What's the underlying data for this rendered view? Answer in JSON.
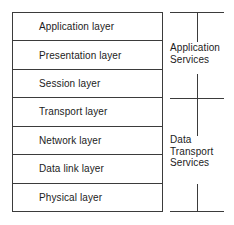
{
  "diagram": {
    "colors": {
      "line": "#3b3b3b",
      "text": "#1c1c1c",
      "background": "#ffffff"
    }
  },
  "layer_stack": {
    "name": "OSI layers",
    "rows": [
      {
        "label": "Application layer"
      },
      {
        "label": "Presentation layer"
      },
      {
        "label": "Session layer"
      },
      {
        "label": "Transport layer"
      },
      {
        "label": "Network layer"
      },
      {
        "label": "Data link layer"
      },
      {
        "label": "Physical layer"
      }
    ]
  },
  "groups": [
    {
      "id": "application-services",
      "lines": [
        "Application",
        "Services"
      ],
      "covers": [
        "Application layer",
        "Presentation layer",
        "Session layer"
      ]
    },
    {
      "id": "data-transport-services",
      "lines": [
        "Data",
        "Transport",
        "Services"
      ],
      "covers": [
        "Transport layer",
        "Network layer",
        "Data link layer",
        "Physical layer"
      ]
    }
  ]
}
